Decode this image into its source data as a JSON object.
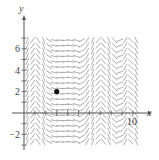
{
  "figure": {
    "type": "slope-field",
    "axes": {
      "x_label": "x",
      "y_label": "y",
      "x_range": [
        -1,
        11
      ],
      "y_range": [
        -3,
        7.5
      ],
      "x_tick_labels": [
        {
          "value": 10,
          "text": "10"
        }
      ],
      "y_tick_labels": [
        {
          "value": 6,
          "text": "6"
        },
        {
          "value": 4,
          "text": "4"
        },
        {
          "value": 2,
          "text": "2"
        },
        {
          "value": -2,
          "text": "−2"
        }
      ],
      "x_ticks": [
        1,
        2,
        3,
        4,
        5,
        6,
        7,
        8,
        9,
        10
      ],
      "y_ticks": [
        -3,
        -2,
        -1,
        1,
        2,
        3,
        4,
        5,
        6,
        7
      ]
    },
    "point": {
      "x": 3,
      "y": 2,
      "label": ""
    },
    "segment_color": "#9a9a9a",
    "axis_color": "#555555",
    "point_color": "#111111",
    "field_columns_x": [
      0.3,
      0.8,
      1.3,
      1.8,
      2.3,
      2.8,
      3.3,
      3.8,
      4.3,
      4.8,
      5.3,
      5.8,
      6.3,
      6.8,
      7.3,
      7.8,
      8.3,
      8.8,
      9.3,
      9.8,
      10.3
    ],
    "field_column_slopes": [
      2.5,
      1.5,
      -1.5,
      -2.5,
      -0.6,
      -0.2,
      -0.1,
      0.0,
      -0.2,
      -0.3,
      0.6,
      1.8,
      2.5,
      1.2,
      -1.2,
      -2.4,
      -1.0,
      0.4,
      1.8,
      -1.0,
      -2.2
    ],
    "field_rows_y": [
      -2.7,
      -2.2,
      -1.7,
      -1.2,
      -0.7,
      -0.2,
      0.3,
      0.8,
      1.3,
      1.8,
      2.3,
      2.8,
      3.3,
      3.8,
      4.3,
      4.8,
      5.3,
      5.8,
      6.3,
      6.8
    ]
  }
}
